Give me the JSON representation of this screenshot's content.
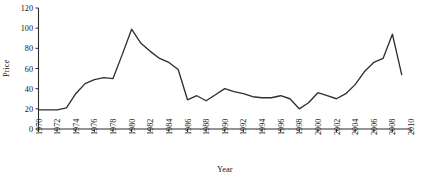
{
  "chart_data": {
    "type": "line",
    "title": "",
    "xlabel": "Year",
    "ylabel": "Price",
    "xlim": [
      1970,
      2010
    ],
    "ylim": [
      0,
      120
    ],
    "grid": false,
    "legend": false,
    "x_tick_labels": [
      "1970",
      "1972",
      "1974",
      "1976",
      "1978",
      "1980",
      "1982",
      "1984",
      "1986",
      "1988",
      "1990",
      "1992",
      "1994",
      "1996",
      "1998",
      "2000",
      "2002",
      "2004",
      "2006",
      "2008",
      "2010"
    ],
    "y_tick_labels": [
      "0",
      "20",
      "40",
      "60",
      "80",
      "100",
      "120"
    ],
    "y_tick_values": [
      0,
      20,
      40,
      60,
      80,
      100,
      120
    ],
    "series": [
      {
        "name": "Price",
        "x": [
          1970,
          1971,
          1972,
          1973,
          1974,
          1975,
          1976,
          1977,
          1978,
          1979,
          1980,
          1981,
          1982,
          1983,
          1984,
          1985,
          1986,
          1987,
          1988,
          1989,
          1990,
          1991,
          1992,
          1993,
          1994,
          1995,
          1996,
          1997,
          1998,
          1999,
          2000,
          2001,
          2002,
          2003,
          2004,
          2005,
          2006,
          2007,
          2008,
          2009
        ],
        "values": [
          19,
          19,
          19,
          21,
          35,
          45,
          49,
          51,
          50,
          74,
          99,
          85,
          77,
          70,
          66,
          59,
          29,
          33,
          28,
          34,
          40,
          37,
          35,
          32,
          31,
          31,
          33,
          30,
          20,
          26,
          36,
          33,
          30,
          35,
          44,
          57,
          66,
          70,
          94,
          54
        ]
      }
    ]
  },
  "axis_titles": {
    "x": "Year",
    "y": "Price"
  },
  "colors": {
    "line": "#2f2f2f",
    "axis": "#2b2b2b",
    "background": "#ffffff"
  }
}
